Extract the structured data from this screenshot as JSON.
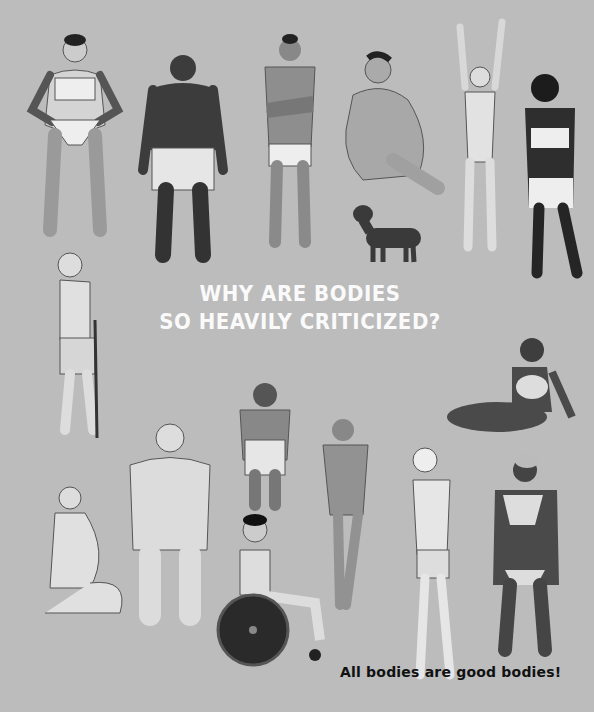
{
  "page": {
    "background": "#bcbcbc",
    "heading": {
      "line1": "WHY ARE BODIES",
      "line2": "SO HEAVILY CRITICIZED?",
      "color": "#fafafa"
    },
    "caption": {
      "text": "All bodies are good bodies!",
      "color": "#111111"
    }
  },
  "illustrations": [
    {
      "id": "figure-1",
      "description": "woman in white bra and briefs, hands on hips"
    },
    {
      "id": "figure-2",
      "description": "man seen from behind in white shorts"
    },
    {
      "id": "figure-3",
      "description": "hairy man with crossed arms in white briefs"
    },
    {
      "id": "figure-4",
      "description": "seated plus-size person"
    },
    {
      "id": "figure-5",
      "description": "slim woman with arms raised"
    },
    {
      "id": "figure-6",
      "description": "woman in white bra and briefs, head bowed"
    },
    {
      "id": "dog",
      "description": "dachshund"
    },
    {
      "id": "figure-7",
      "description": "elderly man with cane"
    },
    {
      "id": "figure-8",
      "description": "woman lounging on floor"
    },
    {
      "id": "figure-9",
      "description": "pregnant woman kneeling"
    },
    {
      "id": "figure-10",
      "description": "plus-size woman in bra and briefs"
    },
    {
      "id": "figure-11",
      "description": "person with short stature"
    },
    {
      "id": "figure-12",
      "description": "bodybuilder woman posing"
    },
    {
      "id": "figure-13",
      "description": "young man in wheelchair"
    },
    {
      "id": "figure-14",
      "description": "slim man with glasses in briefs"
    },
    {
      "id": "figure-15",
      "description": "woman with short grey hair in bra and briefs"
    }
  ]
}
